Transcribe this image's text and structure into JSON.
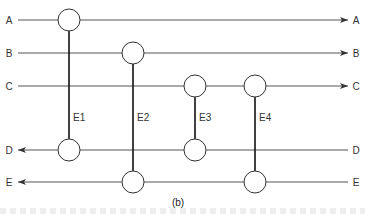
{
  "diagram": {
    "lines": [
      {
        "id": "A",
        "label_left": "A",
        "label_right": "A",
        "direction": "right"
      },
      {
        "id": "B",
        "label_left": "B",
        "label_right": "B",
        "direction": "right"
      },
      {
        "id": "C",
        "label_left": "C",
        "label_right": "C",
        "direction": "right"
      },
      {
        "id": "D",
        "label_left": "D",
        "label_right": "D",
        "direction": "left"
      },
      {
        "id": "E",
        "label_left": "E",
        "label_right": "E",
        "direction": "left"
      }
    ],
    "exchangers": [
      {
        "label": "E1",
        "from": "A",
        "to": "D"
      },
      {
        "label": "E2",
        "from": "B",
        "to": "E"
      },
      {
        "label": "E3",
        "from": "C",
        "to": "D"
      },
      {
        "label": "E4",
        "from": "C",
        "to": "E"
      }
    ],
    "caption": "(b)"
  }
}
